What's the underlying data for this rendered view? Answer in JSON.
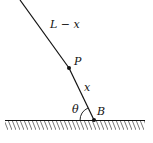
{
  "diagram": {
    "labels": {
      "upper_segment": "L − x",
      "point_p": "P",
      "lower_segment": "x",
      "angle": "θ",
      "point_b": "B"
    },
    "colors": {
      "stroke": "#111111",
      "background": "#ffffff"
    }
  }
}
